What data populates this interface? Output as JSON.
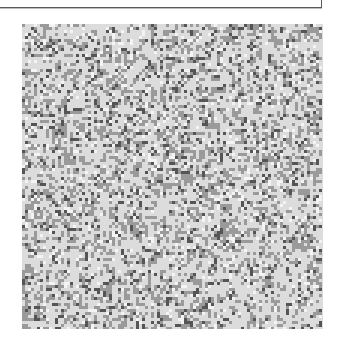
{
  "top_box": {
    "text": ""
  },
  "maze": {
    "cell_px": 3,
    "cols": 100,
    "rows": 102,
    "colors": {
      "light": "#dcdcdc",
      "medium": "#9a9a9a",
      "dark": "#555555",
      "white": "#f4f4f4"
    },
    "seed": 1337
  }
}
